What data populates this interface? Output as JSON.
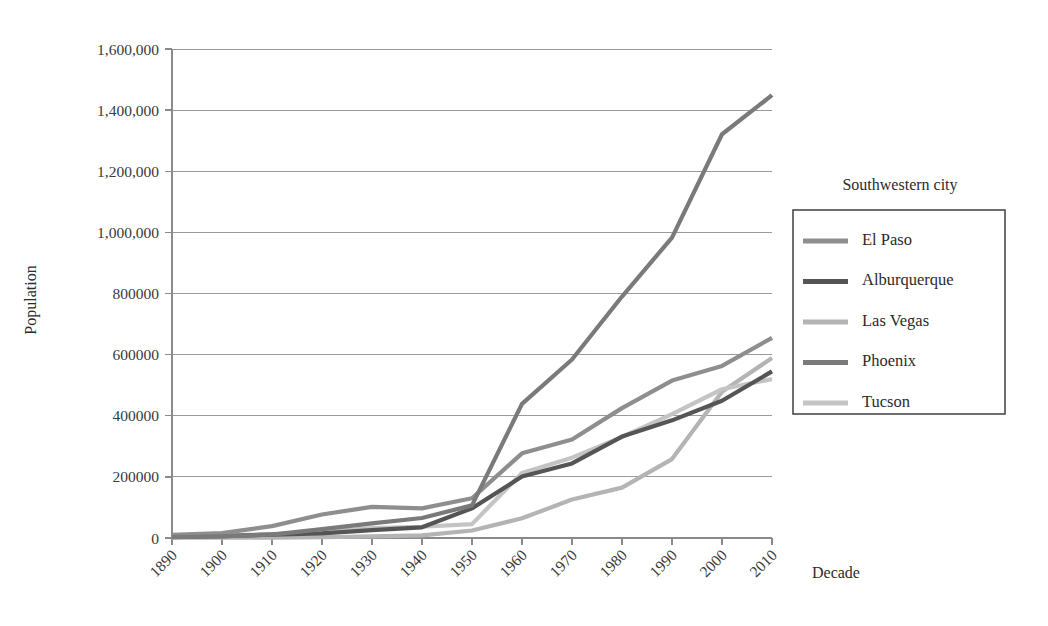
{
  "chart_data": {
    "type": "line",
    "title": "",
    "xlabel": "Decade",
    "ylabel": "Population",
    "x": [
      1890,
      1900,
      1910,
      1920,
      1930,
      1940,
      1950,
      1960,
      1970,
      1980,
      1990,
      2000,
      2010
    ],
    "xticklabels": [
      "1890",
      "1900",
      "1910",
      "1920",
      "1930",
      "1940",
      "1950",
      "1960",
      "1970",
      "1980",
      "1990",
      "2000",
      "2010"
    ],
    "yticks": [
      0,
      200000,
      400000,
      600000,
      800000,
      1000000,
      1200000,
      1400000,
      1600000
    ],
    "yticklabels": [
      "0",
      "200000",
      "400000",
      "600000",
      "800000",
      "1,000,000",
      "1,200,000",
      "1,400,000",
      "1,600,000"
    ],
    "ylim": [
      0,
      1600000
    ],
    "xlim": [
      1890,
      2010
    ],
    "grid": "horizontal",
    "legend_position": "right",
    "legend_title": "Southwestern city",
    "series": [
      {
        "name": "El Paso",
        "color": "#8e8e8e",
        "values": [
          10000,
          16000,
          39000,
          77000,
          102000,
          97000,
          130000,
          277000,
          322000,
          425000,
          515000,
          563000,
          655000
        ]
      },
      {
        "name": "Alburquerque",
        "color": "#555555",
        "values": [
          4000,
          6000,
          11000,
          15000,
          26000,
          35000,
          97000,
          201000,
          244000,
          332000,
          385000,
          449000,
          545000
        ]
      },
      {
        "name": "Las Vegas",
        "color": "#b4b4b4",
        "values": [
          1000,
          1000,
          1000,
          2500,
          5200,
          8400,
          24600,
          64400,
          125800,
          164700,
          258300,
          478400,
          589000
        ]
      },
      {
        "name": "Phoenix",
        "color": "#7a7a7a",
        "values": [
          3100,
          5500,
          11100,
          29000,
          48100,
          65400,
          106800,
          439000,
          584000,
          790000,
          983000,
          1321000,
          1449000
        ]
      },
      {
        "name": "Tucson",
        "color": "#c4c4c4",
        "values": [
          5100,
          7500,
          13100,
          20300,
          32500,
          36800,
          45500,
          212900,
          262900,
          330500,
          405400,
          486700,
          520000
        ]
      }
    ]
  },
  "axes": {
    "y_title": "Population",
    "x_title": "Decade"
  },
  "legend": {
    "title": "Southwestern city",
    "items": [
      {
        "label": "El Paso"
      },
      {
        "label": "Alburquerque"
      },
      {
        "label": "Las Vegas"
      },
      {
        "label": "Phoenix"
      },
      {
        "label": "Tucson"
      }
    ]
  }
}
